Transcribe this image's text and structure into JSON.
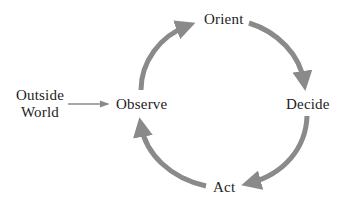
{
  "diagram": {
    "nodes": {
      "outside_world": {
        "line1": "Outside",
        "line2": "World"
      },
      "observe": {
        "label": "Observe"
      },
      "orient": {
        "label": "Orient"
      },
      "decide": {
        "label": "Decide"
      },
      "act": {
        "label": "Act"
      }
    },
    "edges": [
      {
        "from": "Outside World",
        "to": "Observe",
        "style": "thin"
      },
      {
        "from": "Observe",
        "to": "Orient",
        "style": "thick-curved"
      },
      {
        "from": "Orient",
        "to": "Decide",
        "style": "thick-curved"
      },
      {
        "from": "Decide",
        "to": "Act",
        "style": "thick-curved"
      },
      {
        "from": "Act",
        "to": "Observe",
        "style": "thick-curved"
      }
    ],
    "colors": {
      "arrow": "#8a8a8a",
      "text": "#222222",
      "background": "#ffffff"
    }
  }
}
